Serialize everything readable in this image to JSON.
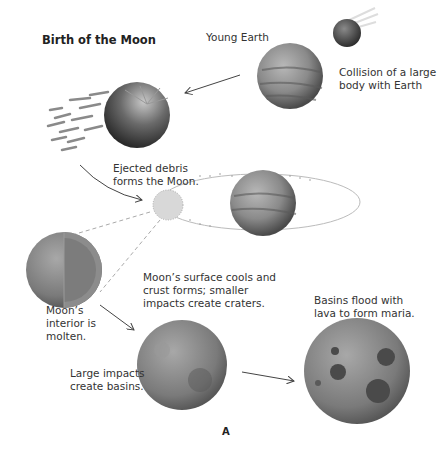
{
  "diagram": {
    "title": "Birth of the Moon",
    "figure_label": "A",
    "labels": {
      "young_earth": "Young Earth",
      "collision_line1": "Collision of a large",
      "collision_line2": "body with Earth",
      "ejected_line1": "Ejected debris",
      "ejected_line2": "forms the Moon.",
      "interior_line1": "Moon’s",
      "interior_line2": "interior is",
      "interior_line3": "molten.",
      "cools_line1": "Moon’s surface cools and",
      "cools_line2": "crust forms; smaller",
      "cools_line3": "impacts create craters.",
      "basins_line1": "Large impacts",
      "basins_line2": "create basins.",
      "maria_line1": "Basins flood with",
      "maria_line2": "lava to form maria."
    },
    "stages": [
      "Collision of a large body with Earth",
      "Ejected debris forms the Moon.",
      "Moon's interior is molten.",
      "Moon's surface cools and crust forms; smaller impacts create craters.",
      "Large impacts create basins.",
      "Basins flood with lava to form maria."
    ],
    "colors": {
      "background": "#ffffff",
      "text": "#333333",
      "sphere_gray": "#8a8a8a",
      "arrow": "#444444"
    }
  }
}
